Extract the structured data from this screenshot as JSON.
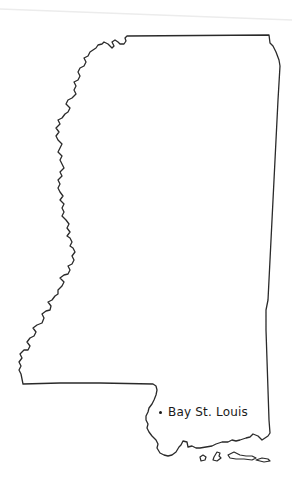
{
  "map": {
    "subject": "Mississippi state outline",
    "outline_color": "#2a2a2a",
    "background_color": "#ffffff"
  },
  "labels": [
    {
      "name": "Bay St. Louis",
      "marker": "dot"
    }
  ]
}
